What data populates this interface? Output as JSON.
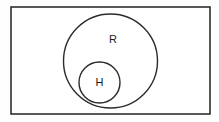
{
  "figure": {
    "type": "venn-diagram",
    "background_color": "#fefefe",
    "stroke_color": "#2b2b2b",
    "label_color": "#1a1a1a",
    "canvas": {
      "width": 219,
      "height": 122
    }
  },
  "universe": {
    "name": "universal-set-rectangle",
    "label": "",
    "x": 11,
    "y": 7,
    "width": 199,
    "height": 107
  },
  "sets": [
    {
      "id": "R",
      "label": "R",
      "shape": "circle",
      "cx": 110.5,
      "cy": 61,
      "r": 47,
      "label_x": 113,
      "label_y": 40
    },
    {
      "id": "H",
      "label": "H",
      "shape": "circle",
      "cx": 99.5,
      "cy": 82.5,
      "r": 20.5,
      "label_x": 99.5,
      "label_y": 83
    }
  ],
  "relations": {
    "description": "H is a proper subset of R; R is contained in the universal set"
  }
}
